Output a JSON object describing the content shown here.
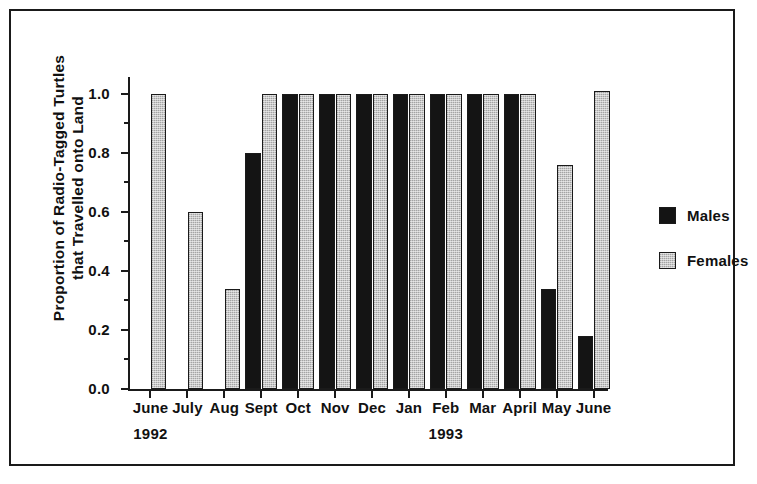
{
  "chart_data": {
    "type": "bar",
    "title": "",
    "xlabel": "",
    "ylabel": "Proportion of Radio-Tagged Turtles that Travelled onto Land",
    "ylabel_lines": [
      "Proportion of Radio-Tagged Turtles",
      "that Travelled onto Land"
    ],
    "categories": [
      "June",
      "July",
      "Aug",
      "Sept",
      "Oct",
      "Nov",
      "Dec",
      "Jan",
      "Feb",
      "Mar",
      "April",
      "May",
      "June"
    ],
    "group_years": [
      "1992",
      "1992",
      "1992",
      "1992",
      "1992",
      "1992",
      "1992",
      "1993",
      "1993",
      "1993",
      "1993",
      "1993",
      "1993"
    ],
    "year_annotations": [
      {
        "label": "1992",
        "under_category": "June"
      },
      {
        "label": "1993",
        "under_category": "Feb"
      }
    ],
    "series": [
      {
        "name": "Males",
        "color": "#141414",
        "values": [
          null,
          null,
          null,
          0.8,
          1.0,
          1.0,
          1.0,
          1.0,
          1.0,
          1.0,
          1.0,
          0.34,
          0.18
        ]
      },
      {
        "name": "Females",
        "color": "#c8c8c8",
        "values": [
          1.0,
          0.6,
          0.34,
          1.0,
          1.0,
          1.0,
          1.0,
          1.0,
          1.0,
          1.0,
          1.0,
          0.76,
          1.01
        ]
      }
    ],
    "ylim": [
      0.0,
      1.05
    ],
    "ytick_values": [
      0.0,
      0.2,
      0.4,
      0.6,
      0.8,
      1.0
    ],
    "ytick_labels": [
      "0.0",
      "0.2",
      "0.4",
      "0.6",
      "0.8",
      "1.0"
    ],
    "yminor_tick_values": [
      0.1,
      0.3,
      0.5,
      0.7,
      0.9
    ],
    "grid": false,
    "legend_position": "right",
    "legend": [
      {
        "label": "Males",
        "swatch": "black-filled-square"
      },
      {
        "label": "Females",
        "swatch": "gray-stippled-square"
      }
    ]
  },
  "figure": {
    "frame_color": "#1a1a1a",
    "background": "#ffffff"
  }
}
